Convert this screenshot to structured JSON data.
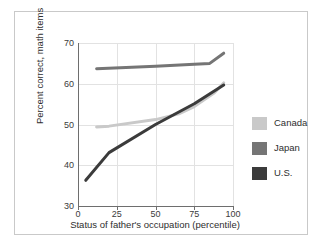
{
  "chart_data": {
    "type": "line",
    "title": "",
    "xlabel": "Status of father's occupation (percentile)",
    "ylabel": "Percent correct, math items",
    "xlim": [
      0,
      100
    ],
    "ylim": [
      30,
      70
    ],
    "xticks": [
      0,
      25,
      50,
      75,
      100
    ],
    "yticks": [
      30,
      40,
      50,
      60,
      70
    ],
    "grid": true,
    "legend_position": "right",
    "series": [
      {
        "name": "Canada",
        "color": "#c9c9c9",
        "x": [
          12,
          20,
          50,
          65,
          75,
          88,
          94
        ],
        "y": [
          49.4,
          49.6,
          51.2,
          52.6,
          54.4,
          57.8,
          60.2
        ]
      },
      {
        "name": "Japan",
        "color": "#757575",
        "x": [
          12,
          50,
          75,
          85,
          94
        ],
        "y": [
          63.7,
          64.3,
          64.8,
          65.0,
          67.5
        ]
      },
      {
        "name": "U.S.",
        "color": "#3b3b3b",
        "x": [
          5,
          20,
          50,
          75,
          94
        ],
        "y": [
          36.3,
          43.1,
          50.0,
          55.1,
          59.7
        ]
      }
    ]
  },
  "legend": {
    "items": [
      {
        "label": "Canada",
        "color": "#c9c9c9"
      },
      {
        "label": "Japan",
        "color": "#757575"
      },
      {
        "label": "U.S.",
        "color": "#3b3b3b"
      }
    ]
  },
  "axis": {
    "y_tick_labels": [
      "30",
      "40",
      "50",
      "60",
      "70"
    ],
    "x_tick_labels": [
      "0",
      "25",
      "50",
      "75",
      "100"
    ],
    "y_title": "Percent correct, math items",
    "x_title": "Status of father's occupation (percentile)"
  }
}
